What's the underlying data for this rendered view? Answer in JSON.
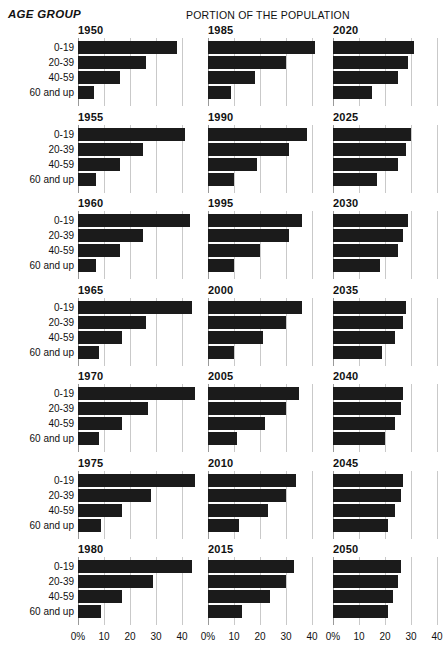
{
  "header": {
    "age_group_label": "AGE GROUP",
    "portion_label": "PORTION OF THE POPULATION"
  },
  "age_labels": [
    "0-19",
    "20-39",
    "40-59",
    "60 and up"
  ],
  "axis": {
    "ticks": [
      "0%",
      "10",
      "20",
      "30",
      "40"
    ],
    "tick_values": [
      0,
      10,
      20,
      30,
      40
    ],
    "min": 0,
    "max": 40
  },
  "colors": {
    "bar": "#1b1b1b",
    "gridline": "#c9c9c9",
    "axis_line": "#9a9a9a",
    "background": "#ffffff",
    "text": "#111111"
  },
  "columns": [
    {
      "panel_years": [
        "1950",
        "1955",
        "1960",
        "1965",
        "1970",
        "1975",
        "1980"
      ]
    },
    {
      "panel_years": [
        "1985",
        "1990",
        "1995",
        "2000",
        "2005",
        "2010",
        "2015"
      ]
    },
    {
      "panel_years": [
        "2020",
        "2025",
        "2030",
        "2035",
        "2040",
        "2045",
        "2050"
      ]
    }
  ],
  "chart_data": {
    "type": "bar",
    "title": "PORTION OF THE POPULATION",
    "subtitle": "AGE GROUP",
    "orientation": "horizontal",
    "xlabel": "",
    "ylabel": "AGE GROUP",
    "xlim": [
      0,
      40
    ],
    "xticks": [
      0,
      10,
      20,
      30,
      40
    ],
    "xticklabels": [
      "0%",
      "10",
      "20",
      "30",
      "40"
    ],
    "grid": true,
    "legend": "none",
    "categories": [
      "0-19",
      "20-39",
      "40-59",
      "60 and up"
    ],
    "units": "percent of population",
    "panels": [
      {
        "year": "1950",
        "values": [
          38,
          26,
          16,
          6
        ]
      },
      {
        "year": "1955",
        "values": [
          41,
          25,
          16,
          7
        ]
      },
      {
        "year": "1960",
        "values": [
          43,
          25,
          16,
          7
        ]
      },
      {
        "year": "1965",
        "values": [
          44,
          26,
          17,
          8
        ]
      },
      {
        "year": "1970",
        "values": [
          45,
          27,
          17,
          8
        ]
      },
      {
        "year": "1975",
        "values": [
          45,
          28,
          17,
          9
        ]
      },
      {
        "year": "1980",
        "values": [
          44,
          29,
          17,
          9
        ]
      },
      {
        "year": "1985",
        "values": [
          41,
          30,
          18,
          9
        ]
      },
      {
        "year": "1990",
        "values": [
          38,
          31,
          19,
          10
        ]
      },
      {
        "year": "1995",
        "values": [
          36,
          31,
          20,
          10
        ]
      },
      {
        "year": "2000",
        "values": [
          36,
          30,
          21,
          10
        ]
      },
      {
        "year": "2005",
        "values": [
          35,
          30,
          22,
          11
        ]
      },
      {
        "year": "2010",
        "values": [
          34,
          30,
          23,
          12
        ]
      },
      {
        "year": "2015",
        "values": [
          33,
          30,
          24,
          13
        ]
      },
      {
        "year": "2020",
        "values": [
          31,
          29,
          25,
          15
        ]
      },
      {
        "year": "2025",
        "values": [
          30,
          28,
          25,
          17
        ]
      },
      {
        "year": "2030",
        "values": [
          29,
          27,
          25,
          18
        ]
      },
      {
        "year": "2035",
        "values": [
          28,
          27,
          24,
          19
        ]
      },
      {
        "year": "2040",
        "values": [
          27,
          26,
          24,
          20
        ]
      },
      {
        "year": "2045",
        "values": [
          27,
          26,
          24,
          21
        ]
      },
      {
        "year": "2050",
        "values": [
          26,
          25,
          23,
          21
        ]
      }
    ]
  }
}
